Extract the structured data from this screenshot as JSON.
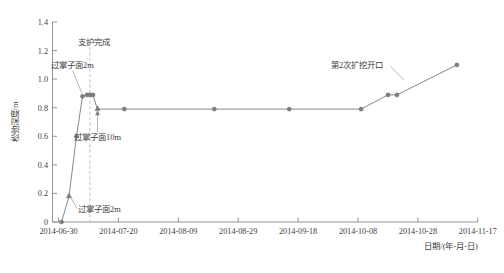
{
  "chart_data": {
    "type": "line",
    "title": "",
    "xlabel": "日期/(年-月-日)",
    "ylabel": "松弛深度/m",
    "grid": false,
    "legend": "none",
    "ylim": [
      0,
      1.4
    ],
    "ytick_labels": [
      "0",
      "0.2",
      "0.4",
      "0.6",
      "0.8",
      "1.0",
      "1.2",
      "1.4"
    ],
    "ytick_values": [
      0,
      0.2,
      0.4,
      0.6,
      0.8,
      1.0,
      1.2,
      1.4
    ],
    "xtick_labels": [
      "2014-06-30",
      "2014-07-20",
      "2014-08-09",
      "2014-08-29",
      "2014-09-18",
      "2014-10-08",
      "2014-10-28",
      "2014-11-17"
    ],
    "xtick_values": [
      0,
      20,
      40,
      60,
      80,
      100,
      120,
      140
    ],
    "xlim": [
      0,
      142
    ],
    "series": [
      {
        "name": "松弛深度",
        "x": [
          1.0,
          3.5,
          6.0,
          8.0,
          9.5,
          10.5,
          11.5,
          13.0,
          22.0,
          52.0,
          77.0,
          101.0,
          110.0,
          113.0,
          133.0
        ],
        "values": [
          0.0,
          0.18,
          0.6,
          0.88,
          0.89,
          0.89,
          0.89,
          0.79,
          0.79,
          0.79,
          0.79,
          0.79,
          0.89,
          0.89,
          1.1
        ]
      }
    ],
    "annotations": [
      {
        "label": "支护完成",
        "x_value": 10.5,
        "note": "vertical dashed event line"
      },
      {
        "label": "过掌子面2m",
        "x_value": 8.0,
        "y_value": 0.88
      },
      {
        "label": "过掌子面10m",
        "x_value": 13.0,
        "y_value": 0.79
      },
      {
        "label": "过掌子面2m",
        "x_value": 3.5,
        "y_value": 0.18
      },
      {
        "label": "第2次扩挖开口",
        "x_value": 113.0,
        "y_value": 0.89
      }
    ]
  },
  "axes": {
    "y_title": "松弛深度/m",
    "x_title": "日期/(年-月-日)"
  },
  "y_ticks": [
    {
      "label": "1.4"
    },
    {
      "label": "1.2"
    },
    {
      "label": "1.0"
    },
    {
      "label": "0.8"
    },
    {
      "label": "0.6"
    },
    {
      "label": "0.4"
    },
    {
      "label": "0.2"
    },
    {
      "label": "0"
    }
  ],
  "x_ticks": [
    {
      "label": "2014-06-30"
    },
    {
      "label": "2014-07-20"
    },
    {
      "label": "2014-08-09"
    },
    {
      "label": "2014-08-29"
    },
    {
      "label": "2014-09-18"
    },
    {
      "label": "2014-10-08"
    },
    {
      "label": "2014-10-28"
    },
    {
      "label": "2014-11-17"
    }
  ],
  "annotations": [
    {
      "label": "支护完成"
    },
    {
      "label": "过掌子面2m"
    },
    {
      "label": "过掌子面10m"
    },
    {
      "label": "过掌子面2m"
    },
    {
      "label": "第2次扩挖开口"
    }
  ]
}
